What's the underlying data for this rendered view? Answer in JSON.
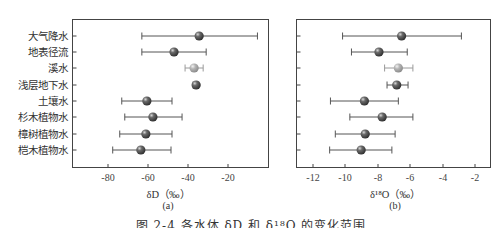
{
  "caption": "图 2-4  各水体 δD 和 δ¹⁸O 的变化范围",
  "categories": [
    "大气降水",
    "地表径流",
    "溪水",
    "浅层地下水",
    "土壤水",
    "杉木植物水",
    "樟树植物水",
    "桤木植物水"
  ],
  "colors": {
    "marker_dark": "#4a4a4a",
    "marker_light": "#a8a8a8",
    "errorbar_dark": "#555555",
    "errorbar_light": "#9a9a9a",
    "frame": "#444444"
  },
  "panels": {
    "a": {
      "tag": "(a)",
      "xlabel": "δD（‰）",
      "xticks": [
        "-80",
        "-60",
        "-40",
        "-20"
      ]
    },
    "b": {
      "tag": "(b)",
      "xlabel": "δ¹⁸O（‰）",
      "xticks": [
        "-12",
        "-10",
        "-8",
        "-6",
        "-4",
        "-2"
      ]
    }
  },
  "chart_data": [
    {
      "type": "scatter",
      "subtype": "horizontal-errorbar",
      "title": "(a)",
      "xlabel": "δD（‰）",
      "ylabel": "",
      "xlim": [
        -97.5,
        0
      ],
      "xticks": [
        -80,
        -60,
        -40,
        -20
      ],
      "grid": false,
      "legend": null,
      "categories": [
        "大气降水",
        "地表径流",
        "溪水",
        "浅层地下水",
        "土壤水",
        "杉木植物水",
        "樟树植物水",
        "桤木植物水"
      ],
      "mean": [
        -34.5,
        -47,
        -37,
        -36,
        -60.5,
        -57.5,
        -61,
        -63.5
      ],
      "lower": [
        -63,
        -63,
        -41.5,
        -37.5,
        -73,
        -71.5,
        -74,
        -77.5
      ],
      "upper": [
        -5.5,
        -31,
        -32.5,
        -35,
        -48,
        -43,
        -48,
        -48.5
      ],
      "highlight": [
        false,
        false,
        true,
        false,
        false,
        false,
        false,
        false
      ]
    },
    {
      "type": "scatter",
      "subtype": "horizontal-errorbar",
      "title": "(b)",
      "xlabel": "δ¹⁸O（‰）",
      "ylabel": "",
      "xlim": [
        -13,
        -1
      ],
      "xticks": [
        -12,
        -10,
        -8,
        -6,
        -4,
        -2
      ],
      "grid": false,
      "legend": null,
      "categories": [
        "大气降水",
        "地表径流",
        "溪水",
        "浅层地下水",
        "土壤水",
        "杉木植物水",
        "樟树植物水",
        "桤木植物水"
      ],
      "mean": [
        -6.5,
        -7.9,
        -6.7,
        -6.8,
        -8.8,
        -7.7,
        -8.75,
        -9.0
      ],
      "lower": [
        -10.15,
        -9.6,
        -7.55,
        -7.4,
        -10.9,
        -9.7,
        -10.6,
        -10.95
      ],
      "upper": [
        -2.8,
        -6.15,
        -5.8,
        -6.1,
        -6.7,
        -5.8,
        -6.9,
        -7.1
      ],
      "highlight": [
        false,
        false,
        true,
        false,
        false,
        false,
        false,
        false
      ]
    }
  ]
}
